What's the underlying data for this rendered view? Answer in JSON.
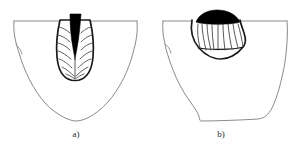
{
  "figure": {
    "background_color": "#ffffff",
    "outline_color": "#8a8a8a",
    "bead_outline_color": "#1a1a1a",
    "fusion_line_color": "#3a3a3a",
    "core_fill_color": "#000000",
    "caption_color": "#2a2a2a",
    "panels": [
      {
        "id": "panel-a",
        "label": "a)",
        "description": "Deep narrow keyhole weld bead with dark V-shaped root cavity and herringbone solidification lines inside a U-shaped heat affected zone",
        "bead_shape": "narrow-elongated-wineglass",
        "core_shape": "narrow-tapering-v",
        "haz_shape": "rounded-u",
        "solidification_line_count": 14
      },
      {
        "id": "panel-b",
        "label": "b)",
        "description": "Shallow wide fan-shaped weld bead with dark elliptical cap and radiating columnar grain lines inside a trapezoidal heat affected zone",
        "bead_shape": "wide-shallow-fan",
        "core_shape": "elliptical-cap",
        "haz_shape": "trapezoidal-bucket",
        "solidification_line_count": 11
      }
    ]
  }
}
